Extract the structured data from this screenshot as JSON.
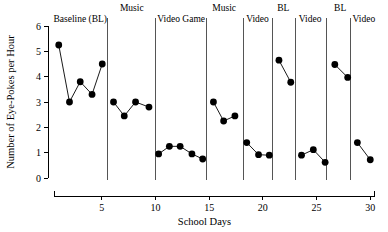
{
  "chart_data": {
    "type": "line",
    "title": "",
    "xlabel": "School Days",
    "ylabel": "Number of Eye-Pokes per Hour",
    "xlim": [
      0,
      31
    ],
    "ylim": [
      0,
      6
    ],
    "xticks": [
      5,
      10,
      15,
      20,
      25,
      30
    ],
    "xtick_labels": [
      "5",
      "10",
      "15",
      "20",
      "25",
      "30"
    ],
    "yticks": [
      0,
      1,
      2,
      3,
      4,
      5,
      6
    ],
    "ytick_labels": [
      "0",
      "1",
      "2",
      "3",
      "4",
      "5",
      "6"
    ],
    "grid": false,
    "legend": "none",
    "marker": "filled-circle",
    "phase_dividers": [
      5.5,
      10.0,
      14.8,
      18.2,
      20.9,
      23.0,
      25.9,
      28.2
    ],
    "phases": [
      {
        "label": "Baseline (BL)",
        "label_row": 1,
        "label_x": 3.0,
        "points": [
          {
            "x": 1.0,
            "y": 5.25
          },
          {
            "x": 2.0,
            "y": 3.0
          },
          {
            "x": 3.0,
            "y": 3.8
          },
          {
            "x": 4.1,
            "y": 3.3
          },
          {
            "x": 5.05,
            "y": 4.5
          }
        ]
      },
      {
        "label": "Music",
        "label_row": 0,
        "label_x": 7.8,
        "points": [
          {
            "x": 6.1,
            "y": 3.0
          },
          {
            "x": 7.1,
            "y": 2.45
          },
          {
            "x": 8.15,
            "y": 3.0
          },
          {
            "x": 9.4,
            "y": 2.8
          }
        ]
      },
      {
        "label": "Video Game",
        "label_row": 1,
        "label_x": 12.4,
        "points": [
          {
            "x": 10.3,
            "y": 0.95
          },
          {
            "x": 11.3,
            "y": 1.25
          },
          {
            "x": 12.3,
            "y": 1.25
          },
          {
            "x": 13.4,
            "y": 0.95
          },
          {
            "x": 14.4,
            "y": 0.75
          }
        ]
      },
      {
        "label": "Music",
        "label_row": 0,
        "label_x": 16.4,
        "points": [
          {
            "x": 15.4,
            "y": 3.0
          },
          {
            "x": 16.35,
            "y": 2.25
          },
          {
            "x": 17.4,
            "y": 2.45
          }
        ]
      },
      {
        "label": "Video",
        "label_row": 1,
        "label_x": 19.5,
        "points": [
          {
            "x": 18.5,
            "y": 1.4
          },
          {
            "x": 19.6,
            "y": 0.92
          },
          {
            "x": 20.6,
            "y": 0.9
          }
        ]
      },
      {
        "label": "BL",
        "label_row": 0,
        "label_x": 21.9,
        "points": [
          {
            "x": 21.5,
            "y": 4.65
          },
          {
            "x": 22.6,
            "y": 3.78
          }
        ]
      },
      {
        "label": "Video",
        "label_row": 1,
        "label_x": 24.4,
        "points": [
          {
            "x": 23.6,
            "y": 0.9
          },
          {
            "x": 24.7,
            "y": 1.12
          },
          {
            "x": 25.8,
            "y": 0.62
          }
        ]
      },
      {
        "label": "BL",
        "label_row": 0,
        "label_x": 27.2,
        "points": [
          {
            "x": 26.7,
            "y": 4.48
          },
          {
            "x": 27.9,
            "y": 3.97
          }
        ]
      },
      {
        "label": "Video",
        "label_row": 1,
        "label_x": 29.4,
        "points": [
          {
            "x": 28.8,
            "y": 1.4
          },
          {
            "x": 30.0,
            "y": 0.72
          }
        ]
      }
    ]
  }
}
